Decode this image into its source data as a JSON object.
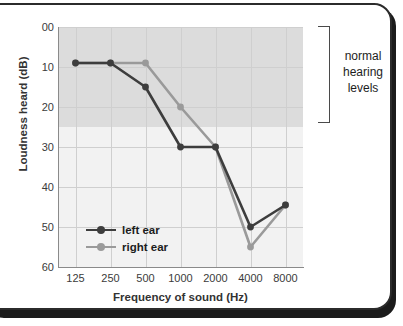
{
  "chart_data": {
    "type": "line",
    "title": "",
    "xlabel": "Frequency of sound (Hz)",
    "ylabel": "Loudness heard (dB)",
    "categories": [
      "125",
      "250",
      "500",
      "1000",
      "2000",
      "4000",
      "8000"
    ],
    "x": [
      125,
      250,
      500,
      1000,
      2000,
      4000,
      8000
    ],
    "ytick_labels": [
      "00",
      "10",
      "20",
      "30",
      "40",
      "50",
      "60"
    ],
    "ytick_values": [
      0,
      10,
      20,
      30,
      40,
      50,
      60
    ],
    "ylim": [
      0,
      60
    ],
    "y_axis_inverted": true,
    "grid": true,
    "legend_position": "inside-bottom-left",
    "series": [
      {
        "name": "left ear",
        "color": "#3d3d3d",
        "marker": "circle",
        "values": [
          9,
          9,
          15,
          30,
          30,
          50,
          44.5
        ]
      },
      {
        "name": "right ear",
        "color": "#9a9a9a",
        "marker": "circle",
        "values": [
          9,
          9,
          9,
          20,
          30,
          55,
          44.5
        ]
      }
    ],
    "annotations": [
      {
        "name": "normal-hearing-band",
        "label": "normal hearing levels",
        "label_lines": [
          "normal",
          "hearing",
          "levels"
        ],
        "y_range": [
          0,
          25
        ],
        "shading_color": "#dcdcdc"
      }
    ]
  },
  "legend": {
    "items": [
      {
        "label": "left ear",
        "color": "#3d3d3d"
      },
      {
        "label": "right ear",
        "color": "#9a9a9a"
      }
    ]
  },
  "annotation": {
    "line1": "normal",
    "line2": "hearing",
    "line3": "levels"
  }
}
